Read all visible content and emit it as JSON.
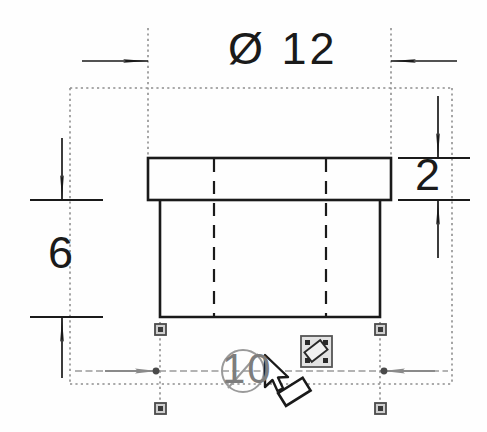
{
  "drawing": {
    "title": "Flanged Bushing Section View",
    "kind": "2d-cad-dimensioned-drawing",
    "background_color": "#fefefe",
    "line_color": "#1a1a1a",
    "selected_color": "#7d7d7d",
    "witness_color": "#9a9a9a"
  },
  "dimensions": {
    "top_diameter": {
      "label": "Ø 12",
      "value": "12",
      "symbol": "Ø",
      "name": "outer-flange-diameter",
      "state": "normal"
    },
    "right_thickness": {
      "label": "2",
      "value": "2",
      "symbol": "",
      "name": "flange-thickness",
      "state": "normal"
    },
    "left_height": {
      "label": "6",
      "value": "6",
      "symbol": "",
      "name": "overall-height",
      "state": "normal"
    },
    "bottom_diameter": {
      "label": "Ø 10",
      "value": "10",
      "symbol": "Ø",
      "name": "body-diameter",
      "state": "selected"
    }
  },
  "selection": {
    "handle_count": "4",
    "handle_color": "#5a5a5a",
    "cursor": "move-dimension-cursor",
    "badge": "edit-dimension-badge"
  },
  "geometry": {
    "flange": {
      "x": 148,
      "y": 158,
      "width": 243,
      "height": 42
    },
    "body": {
      "x": 160,
      "y": 200,
      "width": 220,
      "height": 117
    },
    "hidden_bore_left_x": 214,
    "hidden_bore_right_x": 326
  }
}
